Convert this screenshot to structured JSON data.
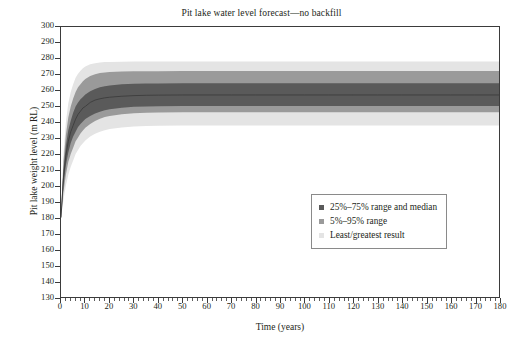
{
  "chart_data": {
    "type": "area",
    "title": "Pit lake water level forecast—no backfill",
    "xlabel": "Time (years)",
    "ylabel": "Pit lake weight level (m RL)",
    "xlim": [
      0,
      180
    ],
    "ylim": [
      130,
      300
    ],
    "xticks": [
      0,
      10,
      20,
      30,
      40,
      50,
      60,
      70,
      80,
      90,
      100,
      110,
      120,
      130,
      140,
      150,
      160,
      170,
      180
    ],
    "yticks": [
      130,
      140,
      150,
      160,
      170,
      180,
      190,
      200,
      210,
      220,
      230,
      240,
      250,
      260,
      270,
      280,
      290,
      300
    ],
    "x_minor_tick_step": 2,
    "grid": false,
    "legend_position": "lower-right-inside",
    "colors": {
      "band_inner": "#5a5a5a",
      "band_mid": "#9a9a9a",
      "band_outer": "#e4e4e4",
      "axis": "#3b3b3b",
      "text": "#231f20",
      "background": "#ffffff"
    },
    "legend": [
      {
        "label": "25%–75% range and median",
        "color": "#5a5a5a",
        "marker": "square"
      },
      {
        "label": "5%–95% range",
        "color": "#9a9a9a",
        "marker": "square"
      },
      {
        "label": "Least/greatest result",
        "color": "#e4e4e4",
        "marker": "square"
      }
    ],
    "x": [
      0,
      1,
      2,
      3,
      4,
      5,
      6,
      7,
      8,
      9,
      10,
      12,
      14,
      16,
      18,
      20,
      25,
      30,
      35,
      40,
      50,
      60,
      70,
      80,
      90,
      100,
      110,
      120,
      130,
      140,
      150,
      160,
      170,
      180
    ],
    "series": [
      {
        "name": "median",
        "values": [
          180,
          205,
          219,
          228,
          234,
          238,
          242,
          245,
          247,
          249,
          250,
          252.5,
          254,
          254.8,
          255.4,
          255.8,
          256.4,
          256.8,
          257,
          257.1,
          257.2,
          257.2,
          257.2,
          257.2,
          257.2,
          257.2,
          257.2,
          257.2,
          257.2,
          257.2,
          257.2,
          257.2,
          257.2,
          257.2
        ]
      },
      {
        "name": "25% (lower quartile)",
        "values": [
          180,
          200,
          213,
          221,
          227,
          231,
          234,
          237,
          239,
          240.5,
          242,
          244,
          245.5,
          246.7,
          247.6,
          248.2,
          249.2,
          249.8,
          250,
          250.1,
          250.2,
          250.2,
          250.2,
          250.2,
          250.2,
          250.2,
          250.2,
          250.2,
          250.2,
          250.2,
          250.2,
          250.2,
          250.2,
          250.2
        ]
      },
      {
        "name": "75% (upper quartile)",
        "values": [
          180,
          210,
          225,
          235,
          241,
          246,
          250,
          252.5,
          254.5,
          256,
          257.5,
          259.5,
          261,
          262,
          262.7,
          263.2,
          263.9,
          264.2,
          264.4,
          264.5,
          264.6,
          264.6,
          264.6,
          264.6,
          264.6,
          264.6,
          264.6,
          264.6,
          264.6,
          264.6,
          264.6,
          264.6,
          264.6,
          264.6
        ]
      },
      {
        "name": "5% (lower)",
        "values": [
          180,
          196,
          207,
          215,
          220,
          224,
          228,
          230.5,
          233,
          234.8,
          236.5,
          239,
          240.8,
          242.2,
          243.3,
          244,
          245.1,
          245.7,
          246,
          246.2,
          246.3,
          246.3,
          246.3,
          246.3,
          246.3,
          246.3,
          246.3,
          246.3,
          246.3,
          246.3,
          246.3,
          246.3,
          246.3,
          246.3
        ]
      },
      {
        "name": "95% (upper)",
        "values": [
          180,
          215,
          232,
          243,
          250,
          255,
          259,
          262,
          264,
          265.8,
          267.3,
          269.2,
          270.3,
          271,
          271.4,
          271.7,
          272,
          272.1,
          272.2,
          272.2,
          272.3,
          272.3,
          272.3,
          272.3,
          272.3,
          272.3,
          272.3,
          272.3,
          272.3,
          272.3,
          272.3,
          272.3,
          272.3,
          272.3
        ]
      },
      {
        "name": "least result",
        "values": [
          180,
          191,
          200,
          207,
          212,
          216,
          220,
          222.5,
          225,
          226.8,
          228.5,
          231,
          232.8,
          234,
          235,
          235.8,
          236.8,
          237.4,
          237.7,
          237.9,
          238,
          238,
          238,
          238,
          238,
          238,
          238,
          238,
          238,
          238,
          238,
          238,
          238,
          238
        ]
      },
      {
        "name": "greatest result",
        "values": [
          180,
          220,
          240,
          252,
          259,
          264,
          268,
          270.5,
          272.5,
          274,
          275.2,
          276.5,
          277.2,
          277.6,
          277.9,
          278,
          278.1,
          278.2,
          278.2,
          278.2,
          278.3,
          278.3,
          278.3,
          278.3,
          278.3,
          278.3,
          278.3,
          278.3,
          278.3,
          278.3,
          278.3,
          278.3,
          278.3,
          278.3
        ]
      }
    ]
  }
}
